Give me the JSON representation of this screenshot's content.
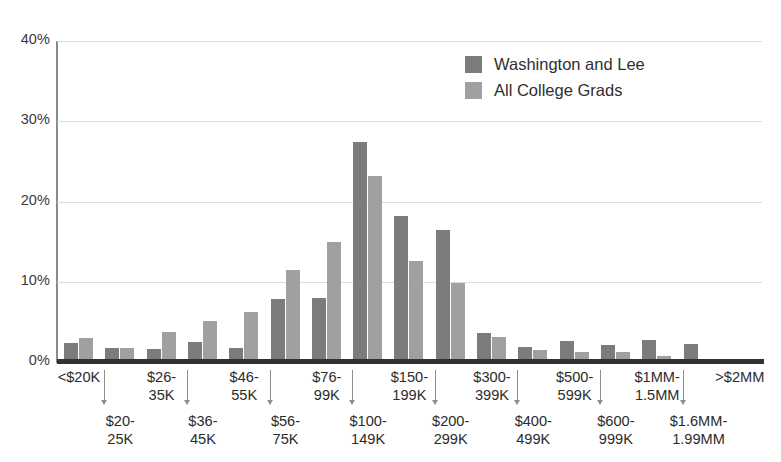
{
  "chart_data": {
    "type": "bar",
    "title": "",
    "subtitle": "",
    "xlabel": "",
    "ylabel": "",
    "ylim": [
      0,
      40
    ],
    "y_ticks": [
      "0%",
      "10%",
      "20%",
      "30%",
      "40%"
    ],
    "y_tick_values": [
      0,
      10,
      20,
      30,
      40
    ],
    "grid": "horizontal",
    "legend_position": "top-right",
    "categories": [
      "<$20K",
      "$20-25K",
      "$26-35K",
      "$36-45K",
      "$46-55K",
      "$56-75K",
      "$76-99K",
      "$100-149K",
      "$150-199K",
      "$200-299K",
      "$300-399K",
      "$400-499K",
      "$500-599K",
      "$600-999K",
      "$1MM-1.5MM",
      "$1.6MM-1.99MM",
      ">$2MM"
    ],
    "category_lines": [
      [
        "<$20K"
      ],
      [
        "$20-",
        "25K"
      ],
      [
        "$26-",
        "35K"
      ],
      [
        "$36-",
        "45K"
      ],
      [
        "$46-",
        "55K"
      ],
      [
        "$56-",
        "75K"
      ],
      [
        "$76-",
        "99K"
      ],
      [
        "$100-",
        "149K"
      ],
      [
        "$150-",
        "199K"
      ],
      [
        "$200-",
        "299K"
      ],
      [
        "$300-",
        "399K"
      ],
      [
        "$400-",
        "499K"
      ],
      [
        "$500-",
        "599K"
      ],
      [
        "$600-",
        "999K"
      ],
      [
        "$1MM-",
        "1.5MM"
      ],
      [
        "$1.6MM-",
        "1.99MM"
      ],
      [
        ">$2MM"
      ]
    ],
    "series": [
      {
        "name": "Washington and Lee",
        "color": "#7c7c7c",
        "values": [
          2.4,
          1.7,
          1.6,
          2.5,
          1.7,
          7.9,
          8.0,
          27.4,
          18.2,
          16.4,
          3.6,
          1.9,
          2.6,
          2.1,
          2.8,
          2.3,
          0.4
        ]
      },
      {
        "name": "All College Grads",
        "color": "#a0a0a0",
        "values": [
          3.0,
          1.8,
          3.8,
          5.1,
          6.2,
          11.5,
          14.9,
          23.2,
          12.6,
          9.8,
          3.1,
          1.5,
          1.2,
          1.2,
          0.7,
          0.4,
          0.4
        ]
      }
    ]
  },
  "legend": {
    "items": [
      {
        "label": "Washington and Lee",
        "color": "#7c7c7c"
      },
      {
        "label": "All College Grads",
        "color": "#a0a0a0"
      }
    ]
  },
  "colors": {
    "series_dark": "#7c7c7c",
    "series_light": "#a0a0a0",
    "gridline": "#dcdcdc",
    "axis": "#8a8a8a",
    "baseline": "#33312f",
    "text": "#2b2b2b",
    "background": "#ffffff"
  }
}
